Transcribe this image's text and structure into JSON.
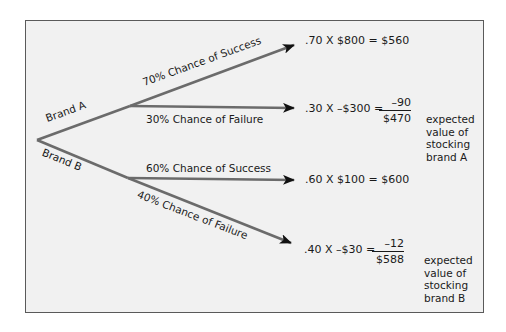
{
  "diagram": {
    "type": "decision-tree",
    "branches": [
      {
        "label": "Brand A",
        "outcomes": [
          {
            "label": "70% Chance of Success",
            "equation": ".70 X $800 = $560"
          },
          {
            "label": "30% Chance of Failure",
            "equation": ".30 X –$300 =",
            "term": "–90",
            "total": "$470"
          }
        ],
        "summary": [
          "expected",
          "value of",
          "stocking",
          "brand A"
        ]
      },
      {
        "label": "Brand B",
        "outcomes": [
          {
            "label": "60% Chance of Success",
            "equation": ".60 X $100 = $600"
          },
          {
            "label": "40% Chance of Failure",
            "equation": ".40 X –$30 =",
            "term": "–12",
            "total": "$588"
          }
        ],
        "summary": [
          "expected",
          "value of",
          "stocking",
          "brand B"
        ]
      }
    ],
    "colors": {
      "line": "#6b6b6b",
      "arrowhead": "#111111",
      "background": "#f1f1f1",
      "border": "#5a5a5a"
    }
  }
}
